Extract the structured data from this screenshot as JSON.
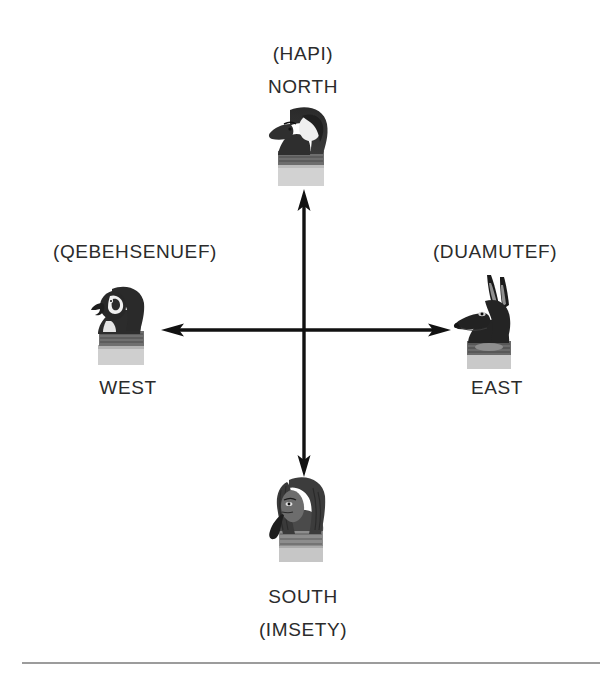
{
  "diagram": {
    "background_color": "#ffffff",
    "text_color": "#2b2b2b",
    "arrow_color": "#111111",
    "rule_color": "#8b8b8b",
    "center": {
      "x": 303,
      "y": 330
    }
  },
  "labels": {
    "north_name": "(HAPI)",
    "north_direction": "NORTH",
    "west_name": "(QEBEHSENUEF)",
    "west_direction": "WEST",
    "east_name": "(DUAMUTEF)",
    "east_direction": "EAST",
    "south_direction": "SOUTH",
    "south_name": "(IMSETY)"
  },
  "figures": {
    "north": {
      "icon": "baboon-head-figure-icon",
      "deity": "Hapi",
      "direction": "NORTH",
      "head": "baboon",
      "facing": "left"
    },
    "west": {
      "icon": "falcon-head-figure-icon",
      "deity": "Qebehsenuef",
      "direction": "WEST",
      "head": "falcon",
      "facing": "left"
    },
    "east": {
      "icon": "jackal-head-figure-icon",
      "deity": "Duamutef",
      "direction": "EAST",
      "head": "jackal",
      "facing": "left"
    },
    "south": {
      "icon": "human-head-figure-icon",
      "deity": "Imsety",
      "direction": "SOUTH",
      "head": "human",
      "facing": "left"
    }
  },
  "arrows": {
    "vertical": {
      "icon": "double-headed-vertical-arrow-icon",
      "from": "SOUTH",
      "to": "NORTH",
      "x": 304,
      "y_top": 193,
      "y_bottom": 472
    },
    "horizontal": {
      "icon": "double-headed-horizontal-arrow-icon",
      "from": "WEST",
      "to": "EAST",
      "y": 330,
      "x_left": 164,
      "x_right": 443
    }
  },
  "footer": {
    "rule": "horizontal-divider"
  }
}
